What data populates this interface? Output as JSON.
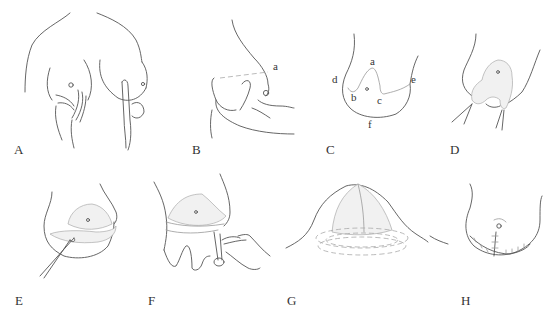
{
  "figure": {
    "panels": [
      {
        "id": "A",
        "label": "A",
        "description": "Bilateral breast palpation with hands"
      },
      {
        "id": "B",
        "label": "B",
        "description": "Lateral view, hand lifting breast",
        "annotations": [
          "a"
        ]
      },
      {
        "id": "C",
        "label": "C",
        "description": "Incision outline with landmarks",
        "annotations": [
          "a",
          "b",
          "c",
          "d",
          "e",
          "f"
        ]
      },
      {
        "id": "D",
        "label": "D",
        "description": "Flap elevated with retractors"
      },
      {
        "id": "E",
        "label": "E",
        "description": "Dissection with instrument"
      },
      {
        "id": "F",
        "label": "F",
        "description": "Excision with scissors"
      },
      {
        "id": "G",
        "label": "G",
        "description": "Reshaped breast mound with concentric dashed contours"
      },
      {
        "id": "H",
        "label": "H",
        "description": "Closure with inverted-T suture line"
      }
    ],
    "colors": {
      "line": "#555555",
      "light_line": "#999999",
      "background": "#ffffff"
    }
  }
}
